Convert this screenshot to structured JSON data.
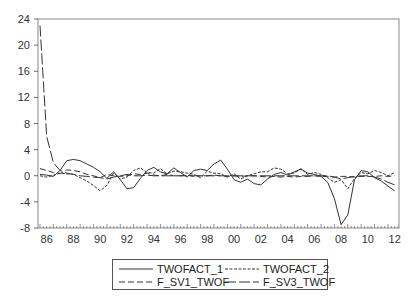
{
  "chart_data": {
    "type": "line",
    "title": "",
    "xlabel": "",
    "ylabel": "",
    "ylim": [
      -8,
      24
    ],
    "xlim": [
      1986,
      2012.75
    ],
    "yticks": [
      -8,
      -4,
      0,
      4,
      8,
      12,
      16,
      20,
      24
    ],
    "xticks": [
      "86",
      "88",
      "90",
      "92",
      "94",
      "96",
      "98",
      "00",
      "02",
      "04",
      "06",
      "08",
      "10",
      "12"
    ],
    "grid": false,
    "legend_position": "bottom",
    "x": [
      1986.0,
      1986.5,
      1987.0,
      1987.5,
      1988.0,
      1988.5,
      1989.0,
      1989.5,
      1990.0,
      1990.5,
      1991.0,
      1991.5,
      1992.0,
      1992.5,
      1993.0,
      1993.5,
      1994.0,
      1994.5,
      1995.0,
      1995.5,
      1996.0,
      1996.5,
      1997.0,
      1997.5,
      1998.0,
      1998.5,
      1999.0,
      1999.5,
      2000.0,
      2000.5,
      2001.0,
      2001.5,
      2002.0,
      2002.5,
      2003.0,
      2003.5,
      2004.0,
      2004.5,
      2005.0,
      2005.5,
      2006.0,
      2006.5,
      2007.0,
      2007.5,
      2008.0,
      2008.5,
      2009.0,
      2009.5,
      2010.0,
      2010.5,
      2011.0,
      2011.5,
      2012.0,
      2012.5
    ],
    "series": [
      {
        "name": "TWOFACT_1",
        "style": "solid",
        "values": [
          0.2,
          0.1,
          -0.1,
          0.8,
          2.3,
          2.5,
          2.3,
          1.8,
          1.3,
          0.6,
          -0.4,
          0.6,
          -0.6,
          -2.0,
          -1.8,
          -0.4,
          0.8,
          1.3,
          0.6,
          0.3,
          1.2,
          0.5,
          -0.2,
          0.8,
          1.0,
          0.8,
          1.8,
          2.4,
          1.0,
          -0.6,
          -1.0,
          -0.5,
          -1.2,
          -1.4,
          -0.5,
          0.2,
          0.5,
          0.1,
          0.6,
          1.0,
          0.4,
          0.2,
          -0.1,
          -1.0,
          -3.5,
          -7.5,
          -6.0,
          -0.6,
          0.8,
          0.6,
          -0.3,
          -0.8,
          -1.6,
          -2.3
        ]
      },
      {
        "name": "TWOFACT_2",
        "style": "dotted-dash",
        "values": [
          0.0,
          -0.2,
          0.1,
          0.4,
          0.3,
          0.2,
          -0.3,
          -0.8,
          -1.5,
          -2.3,
          -1.5,
          0.4,
          -0.5,
          -0.2,
          0.8,
          1.2,
          0.5,
          0.4,
          1.1,
          0.3,
          0.7,
          0.6,
          0.4,
          0.2,
          -0.3,
          0.7,
          0.4,
          0.3,
          -0.2,
          0.3,
          -0.5,
          0.0,
          0.3,
          0.6,
          0.6,
          1.2,
          1.0,
          0.3,
          0.4,
          1.1,
          0.2,
          0.5,
          0.2,
          -0.3,
          -1.0,
          -0.6,
          -2.0,
          -0.4,
          0.5,
          0.3,
          0.8,
          0.5,
          0.0,
          0.5
        ]
      },
      {
        "name": "F_SV1_TWOF",
        "style": "dashed",
        "values": [
          1.1,
          0.8,
          0.5,
          0.3,
          0.9,
          0.8,
          0.6,
          0.2,
          0.0,
          -0.3,
          0.2,
          0.0,
          -0.1,
          0.0,
          0.3,
          0.2,
          0.4,
          0.1,
          0.0,
          0.2,
          0.0,
          0.0,
          0.1,
          -0.1,
          0.0,
          0.0,
          0.1,
          0.0,
          -0.1,
          0.0,
          -0.1,
          0.0,
          0.0,
          -0.1,
          -0.2,
          -0.1,
          -0.2,
          -0.1,
          -0.2,
          -0.1,
          -0.1,
          0.0,
          -0.1,
          -0.1,
          -0.2,
          -0.1,
          -0.1,
          -0.2,
          -0.1,
          -0.1,
          -0.1,
          0.0,
          -0.1,
          0.0
        ]
      },
      {
        "name": "F_SV3_TWOF",
        "style": "long-dash",
        "values": [
          23.0,
          6.0,
          2.0,
          0.8,
          0.4,
          0.2,
          0.0,
          -0.1,
          -0.2,
          -0.3,
          -0.5,
          -0.2,
          0.0,
          0.2,
          0.0,
          0.0,
          0.1,
          0.0,
          0.0,
          0.0,
          0.0,
          0.0,
          0.0,
          0.0,
          0.0,
          0.0,
          0.0,
          0.0,
          0.0,
          0.0,
          0.0,
          0.0,
          0.0,
          0.0,
          0.0,
          0.0,
          0.0,
          0.0,
          0.0,
          0.0,
          0.0,
          0.0,
          0.0,
          0.0,
          -0.2,
          -0.5,
          -0.3,
          -0.1,
          0.0,
          0.0,
          -0.2,
          -0.5,
          -1.0,
          -1.4
        ]
      }
    ]
  },
  "legend": {
    "items": [
      {
        "label": "TWOFACT_1"
      },
      {
        "label": "TWOFACT_2"
      },
      {
        "label": "F_SV1_TWOF"
      },
      {
        "label": "F_SV3_TWOF"
      }
    ]
  }
}
